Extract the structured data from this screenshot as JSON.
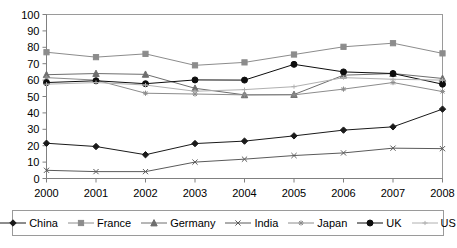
{
  "chart_data": {
    "type": "line",
    "title": "",
    "subtitle": "",
    "xlabel": "",
    "ylabel": "",
    "categories": [
      "2000",
      "2001",
      "2002",
      "2003",
      "2004",
      "2005",
      "2006",
      "2007",
      "2008"
    ],
    "x": [
      2000,
      2001,
      2002,
      2003,
      2004,
      2005,
      2006,
      2007,
      2008
    ],
    "xlim": [
      2000,
      2008
    ],
    "ylim": [
      0,
      100
    ],
    "y_ticks": [
      0,
      10,
      20,
      30,
      40,
      50,
      60,
      70,
      80,
      90,
      100
    ],
    "grid": false,
    "legend_position": "bottom",
    "series": [
      {
        "name": "China",
        "marker": "diamond",
        "color": "#1a1a1a",
        "values": [
          21.5,
          19.5,
          14.5,
          21.3,
          22.8,
          26.0,
          29.5,
          31.5,
          42.3
        ]
      },
      {
        "name": "France",
        "marker": "square",
        "color": "#8c8c8c",
        "values": [
          77.0,
          74.0,
          76.0,
          69.0,
          70.8,
          75.6,
          80.3,
          82.5,
          76.3
        ]
      },
      {
        "name": "Germany",
        "marker": "triangle",
        "color": "#6e6e6e",
        "values": [
          63.3,
          64.0,
          63.5,
          55.0,
          51.0,
          51.2,
          63.0,
          64.0,
          61.0
        ]
      },
      {
        "name": "India",
        "marker": "cross",
        "color": "#5a5a5a",
        "values": [
          5.0,
          4.2,
          4.2,
          10.0,
          11.8,
          14.0,
          15.6,
          18.5,
          18.2
        ]
      },
      {
        "name": "Japan",
        "marker": "asterisk",
        "color": "#8c8c8c",
        "values": [
          61.5,
          60.0,
          52.0,
          51.5,
          51.0,
          51.0,
          54.5,
          58.5,
          53.0
        ]
      },
      {
        "name": "UK",
        "marker": "circle",
        "color": "#0d0d0d",
        "values": [
          58.5,
          59.6,
          57.8,
          60.1,
          60.0,
          69.6,
          65.0,
          64.0,
          57.5
        ]
      },
      {
        "name": "US",
        "marker": "line",
        "color": "#b0b0b0",
        "values": [
          57.5,
          58.5,
          57.0,
          53.2,
          54.2,
          56.0,
          61.5,
          60.5,
          60.0
        ]
      }
    ]
  },
  "legend": {
    "items": [
      {
        "label": "China"
      },
      {
        "label": "France"
      },
      {
        "label": "Germany"
      },
      {
        "label": "India"
      },
      {
        "label": "Japan"
      },
      {
        "label": "UK"
      },
      {
        "label": "US"
      }
    ]
  }
}
